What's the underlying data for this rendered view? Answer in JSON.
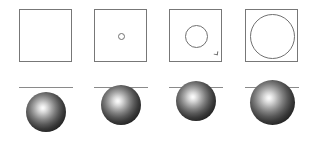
{
  "figure": {
    "background_color": "#ffffff",
    "width": 322,
    "height": 151,
    "stroke_color": "#777777",
    "line_color": "#8a8a8a",
    "sphere_highlight_color": "#fdfdfd",
    "sphere_shadow_color": "#111111"
  },
  "panels": [
    {
      "index": 1,
      "top": {
        "shape": "square-frame",
        "circle_size": "none",
        "circle_diameter_px": 0,
        "square_size_px": 53
      },
      "bottom": {
        "shape": "sphere-below-line",
        "sphere_diameter_px": 40,
        "line_y_px": 87,
        "sphere_top_y_px": 92,
        "penetration_depth_px": 0,
        "contact": "no-contact"
      }
    },
    {
      "index": 2,
      "top": {
        "shape": "square-frame",
        "circle_size": "tiny",
        "circle_diameter_px": 7,
        "square_size_px": 53
      },
      "bottom": {
        "shape": "sphere-crossing-line",
        "sphere_diameter_px": 40,
        "line_y_px": 87,
        "sphere_top_y_px": 85,
        "penetration_depth_px": 2,
        "contact": "shallow"
      }
    },
    {
      "index": 3,
      "top": {
        "shape": "square-frame",
        "circle_size": "medium",
        "circle_diameter_px": 23,
        "square_size_px": 53,
        "has_notch": true
      },
      "bottom": {
        "shape": "sphere-crossing-line",
        "sphere_diameter_px": 40,
        "line_y_px": 87,
        "sphere_top_y_px": 81,
        "penetration_depth_px": 6,
        "contact": "partial"
      }
    },
    {
      "index": 4,
      "top": {
        "shape": "square-frame",
        "circle_size": "large",
        "circle_diameter_px": 45,
        "square_size_px": 53
      },
      "bottom": {
        "shape": "sphere-centered-on-line",
        "sphere_diameter_px": 45,
        "line_y_px": 87,
        "sphere_top_y_px": 80,
        "penetration_depth_px": 22,
        "contact": "equator"
      }
    }
  ]
}
